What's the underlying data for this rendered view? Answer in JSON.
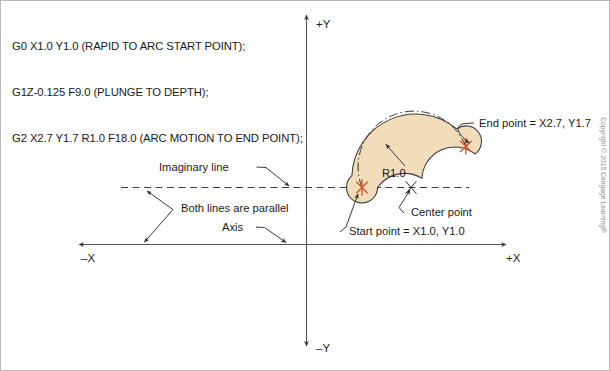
{
  "gcode": {
    "lines": [
      "G0 X1.0 Y1.0 (RAPID TO ARC START POINT);",
      "G1Z-0.125 F9.0 (PLUNGE TO DEPTH);",
      "G2 X2.7 Y1.7 R1.0 F18.0 (ARC MOTION TO END POINT);"
    ]
  },
  "axes": {
    "x_positive": "+X",
    "x_negative": "–X",
    "y_positive": "+Y",
    "y_negative": "–Y"
  },
  "annotations": {
    "imaginary_line": "Imaginary line",
    "both_parallel": "Both lines are parallel",
    "axis": "Axis",
    "radius": "R1.0",
    "center_point": "Center point",
    "start_point": "Start point = X1.0, Y1.0",
    "end_point": "End point = X2.7, Y1.7"
  },
  "colors": {
    "slot_fill": "#f2ddbb",
    "slot_stroke": "#3d3d3d",
    "point_marker": "#d94a2b",
    "axis_line": "#555555",
    "text": "#1a1a1a",
    "copyright_text": "#8d8d8d",
    "page_border": "#b9b9b9"
  },
  "footer": {
    "copyright": "Copyright © 2015 Cengage Learning®"
  }
}
